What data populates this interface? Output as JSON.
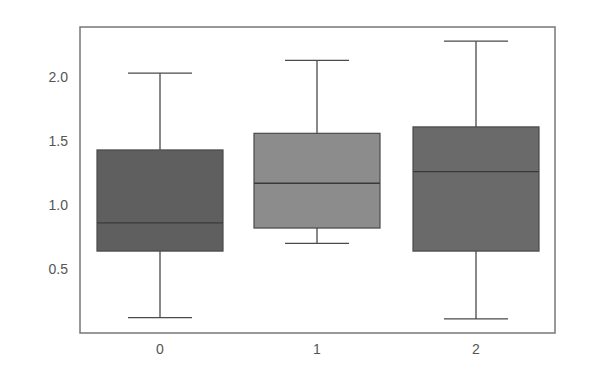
{
  "chart_data": {
    "type": "box",
    "title": "",
    "xlabel": "",
    "ylabel": "",
    "categories": [
      "0",
      "1",
      "2"
    ],
    "ylim": [
      0.0,
      2.4
    ],
    "yticks": [
      0.5,
      1.0,
      1.5,
      2.0
    ],
    "ytick_labels": [
      "0.5",
      "1.0",
      "1.5",
      "2.0"
    ],
    "grid": false,
    "legend": null,
    "boxes": [
      {
        "category": "0",
        "whisker_low": 0.12,
        "q1": 0.64,
        "median": 0.86,
        "q3": 1.43,
        "whisker_high": 2.03,
        "color": "#5f5f5f"
      },
      {
        "category": "1",
        "whisker_low": 0.7,
        "q1": 0.82,
        "median": 1.17,
        "q3": 1.56,
        "whisker_high": 2.13,
        "color": "#8c8c8c"
      },
      {
        "category": "2",
        "whisker_low": 0.11,
        "q1": 0.64,
        "median": 1.26,
        "q3": 1.61,
        "whisker_high": 2.28,
        "color": "#6a6a6a"
      }
    ]
  },
  "style": {
    "frame_color": "#777777",
    "line_color": "#4a4a4a",
    "tick_label_color": "#555555"
  }
}
